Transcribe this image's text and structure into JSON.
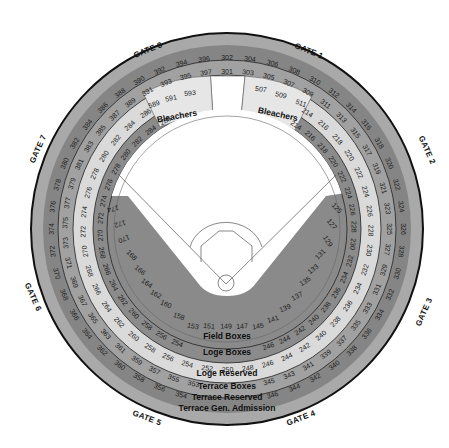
{
  "colors": {
    "gen_admission": "#a9a9a9",
    "terrace_reserved": "#858585",
    "terrace_boxes": "#a1a1a1",
    "loge_reserved": "#dadada",
    "loge_boxes": "#8b8b8b",
    "field_boxes": "#8a8a8a",
    "bleachers": "#e6e6e6",
    "field": "#ffffff",
    "outline": "#111111"
  },
  "gates": [
    {
      "label": "GATE 8",
      "x": 148,
      "y": 50,
      "rot": -22
    },
    {
      "label": "GATE 1",
      "x": 309,
      "y": 51,
      "rot": 22
    },
    {
      "label": "GATE 2",
      "x": 427,
      "y": 150,
      "rot": 66
    },
    {
      "label": "GATE 3",
      "x": 424,
      "y": 312,
      "rot": -66
    },
    {
      "label": "GATE 4",
      "x": 301,
      "y": 418,
      "rot": -21
    },
    {
      "label": "GATE 5",
      "x": 147,
      "y": 418,
      "rot": 21
    },
    {
      "label": "GATE 6",
      "x": 33,
      "y": 297,
      "rot": 66
    },
    {
      "label": "GATE 7",
      "x": 38,
      "y": 149,
      "rot": -66
    }
  ],
  "zones": {
    "terrace_gen_admission": {
      "label": "Terrace Gen. Admission",
      "x": 227,
      "y": 411
    },
    "terrace_reserved": {
      "label": "Terrace Reserved",
      "x": 227,
      "y": 400
    },
    "terrace_boxes": {
      "label": "Terrace Boxes",
      "x": 227,
      "y": 389
    },
    "loge_reserved": {
      "label": "Loge Reserved",
      "x": 227,
      "y": 376
    },
    "loge_boxes": {
      "label": "Loge Boxes",
      "x": 227,
      "y": 355
    },
    "field_boxes": {
      "label": "Field Boxes",
      "x": 227,
      "y": 339
    }
  },
  "bleachers": {
    "left": {
      "label": "Bleachers",
      "x": 177,
      "y": 116,
      "rot": -10,
      "sections": [
        {
          "n": "589",
          "x": 154,
          "y": 104,
          "rot": -18
        },
        {
          "n": "591",
          "x": 171,
          "y": 98,
          "rot": -12
        },
        {
          "n": "593",
          "x": 190,
          "y": 93,
          "rot": -6
        }
      ]
    },
    "right": {
      "label": "Bleachers",
      "x": 278,
      "y": 114,
      "rot": 12,
      "sections": [
        {
          "n": "507",
          "x": 261,
          "y": 89,
          "rot": 8
        },
        {
          "n": "509",
          "x": 281,
          "y": 95,
          "rot": 13
        },
        {
          "n": "511",
          "x": 301,
          "y": 103,
          "rot": 20
        }
      ]
    }
  },
  "rings": [
    {
      "name": "terrace-reserved-sections",
      "r": 176,
      "groups": [
        {
          "start": 0,
          "step": 7.5,
          "numbers": [
            "302",
            "304",
            "306",
            "308",
            "310",
            "312",
            "314",
            "316",
            "318",
            "320",
            "322",
            "324",
            "326",
            "328",
            "330",
            "332",
            "334",
            "336",
            "338",
            "340",
            "342",
            "344",
            "346"
          ]
        },
        {
          "start": -7.5,
          "step": -7.5,
          "numbers": [
            "396",
            "394",
            "392",
            "390",
            "388",
            "386",
            "384",
            "382",
            "380",
            "378",
            "376",
            "374",
            "372",
            "370",
            "368",
            "366",
            "364",
            "362",
            "360",
            "358",
            "356",
            "354"
          ]
        }
      ]
    },
    {
      "name": "terrace-boxes-sections",
      "r": 162,
      "groups": [
        {
          "start": 0,
          "step": 7.5,
          "numbers": [
            "301",
            "303",
            "305",
            "307",
            "309",
            "311",
            "313",
            "315",
            "317",
            "319",
            "321",
            "323",
            "325",
            "327",
            "329",
            "331",
            "333",
            "335",
            "337",
            "339",
            "341",
            "343",
            "345"
          ]
        },
        {
          "start": -7.5,
          "step": -7.3,
          "numbers": [
            "397",
            "395",
            "393",
            "391",
            "389",
            "387",
            "385",
            "383",
            "381",
            "379",
            "377",
            "375",
            "373",
            "371",
            "369",
            "367",
            "365",
            "363",
            "361",
            "359",
            "357",
            "355",
            "353"
          ]
        }
      ]
    },
    {
      "name": "loge-reserved-sections",
      "r": 144,
      "groups": [
        {
          "start": 34,
          "step": 8.1,
          "numbers": [
            "214",
            "216",
            "218",
            "220",
            "222",
            "224",
            "226",
            "228",
            "230",
            "232",
            "234",
            "236",
            "238",
            "240",
            "242",
            "244",
            "246",
            "248",
            "250",
            "252",
            "254",
            "256",
            "258",
            "260",
            "262",
            "264",
            "266",
            "268",
            "270",
            "272",
            "274",
            "276",
            "278",
            "280",
            "282",
            "284",
            "286"
          ]
        }
      ]
    },
    {
      "name": "loge-boxes-sections",
      "r": 127,
      "groups": [
        {
          "start": 33,
          "step": 8.0,
          "numbers": [
            "214",
            "216",
            "218",
            "220",
            "222",
            "224",
            "226",
            "228",
            "230",
            "232",
            "234",
            "236",
            "238",
            "240",
            "242",
            "244",
            "246"
          ]
        },
        {
          "start": 203,
          "step": 8.0,
          "numbers": [
            "254",
            "256",
            "258",
            "260",
            "262",
            "264",
            "266",
            "268",
            "270",
            "272",
            "274",
            "276",
            "278",
            "280",
            "282",
            "284",
            "286"
          ]
        }
      ]
    }
  ],
  "field_sections": [
    {
      "n": "174",
      "x": 113,
      "y": 209
    },
    {
      "n": "172",
      "x": 120,
      "y": 224
    },
    {
      "n": "170",
      "x": 124,
      "y": 239
    },
    {
      "n": "168",
      "x": 132,
      "y": 255
    },
    {
      "n": "166",
      "x": 140,
      "y": 270
    },
    {
      "n": "164",
      "x": 147,
      "y": 283
    },
    {
      "n": "162",
      "x": 156,
      "y": 294
    },
    {
      "n": "160",
      "x": 166,
      "y": 304
    },
    {
      "n": "158",
      "x": 179,
      "y": 316
    },
    {
      "n": "153",
      "x": 193,
      "y": 326
    },
    {
      "n": "151",
      "x": 209,
      "y": 326
    },
    {
      "n": "149",
      "x": 226,
      "y": 326
    },
    {
      "n": "147",
      "x": 242,
      "y": 326
    },
    {
      "n": "145",
      "x": 258,
      "y": 326
    },
    {
      "n": "141",
      "x": 273,
      "y": 319
    },
    {
      "n": "139",
      "x": 285,
      "y": 308
    },
    {
      "n": "137",
      "x": 297,
      "y": 296
    },
    {
      "n": "135",
      "x": 305,
      "y": 281
    },
    {
      "n": "133",
      "x": 313,
      "y": 269
    },
    {
      "n": "131",
      "x": 320,
      "y": 254
    },
    {
      "n": "129",
      "x": 328,
      "y": 241
    },
    {
      "n": "127",
      "x": 332,
      "y": 224
    },
    {
      "n": "125",
      "x": 337,
      "y": 208
    }
  ]
}
